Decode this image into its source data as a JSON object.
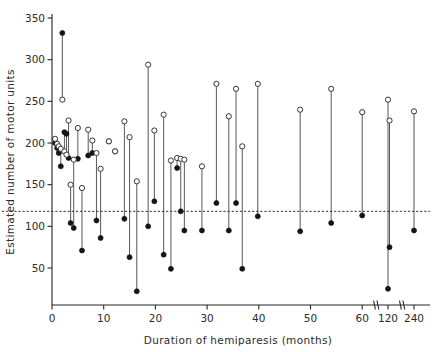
{
  "chart_data": {
    "type": "scatter",
    "title": "",
    "subtitle": "",
    "xlabel": "Duration of hemiparesis (months)",
    "ylabel": "Estimated number of motor units",
    "xlim": [
      0,
      63
    ],
    "ylim": [
      0,
      350
    ],
    "grid": false,
    "legend_position": "none",
    "axis_break": {
      "present": true,
      "note": "x-axis compressed after 60; break marks drawn between 60 and 120 and between 120 and 240",
      "break_labels": [
        "60",
        "120",
        "240"
      ]
    },
    "xticks": [
      0,
      10,
      20,
      30,
      40,
      50,
      60,
      120,
      240
    ],
    "xticklabels": [
      "0",
      "10",
      "20",
      "30",
      "40",
      "50",
      "60",
      "120",
      "240"
    ],
    "yticks": [
      50,
      100,
      150,
      200,
      250,
      300,
      350
    ],
    "yticklabels": [
      "50",
      "100",
      "150",
      "200",
      "250",
      "300",
      "350"
    ],
    "reference_line": {
      "orientation": "horizontal",
      "value": 118,
      "style": "dashed",
      "label": ""
    },
    "marker_styles": {
      "open_circle": "affected / paretic side upper value",
      "filled_circle": "lower value"
    },
    "series": [
      {
        "name": "open-circle (upper point)",
        "marker": "open-circle",
        "points": [
          {
            "x": 0.6,
            "y": 205
          },
          {
            "x": 1.0,
            "y": 199
          },
          {
            "x": 1.3,
            "y": 196
          },
          {
            "x": 1.7,
            "y": 193
          },
          {
            "x": 2.0,
            "y": 252
          },
          {
            "x": 2.4,
            "y": 190
          },
          {
            "x": 2.8,
            "y": 186
          },
          {
            "x": 3.2,
            "y": 227
          },
          {
            "x": 3.6,
            "y": 150
          },
          {
            "x": 4.2,
            "y": 180
          },
          {
            "x": 5.0,
            "y": 218
          },
          {
            "x": 5.8,
            "y": 146
          },
          {
            "x": 7.0,
            "y": 216
          },
          {
            "x": 7.8,
            "y": 203
          },
          {
            "x": 8.6,
            "y": 188
          },
          {
            "x": 9.4,
            "y": 169
          },
          {
            "x": 11.0,
            "y": 202
          },
          {
            "x": 12.2,
            "y": 190
          },
          {
            "x": 14.0,
            "y": 226
          },
          {
            "x": 15.0,
            "y": 207
          },
          {
            "x": 16.4,
            "y": 154
          },
          {
            "x": 18.6,
            "y": 294
          },
          {
            "x": 19.8,
            "y": 215
          },
          {
            "x": 21.6,
            "y": 234
          },
          {
            "x": 23.0,
            "y": 179
          },
          {
            "x": 24.2,
            "y": 182
          },
          {
            "x": 24.9,
            "y": 181
          },
          {
            "x": 25.6,
            "y": 180
          },
          {
            "x": 29.0,
            "y": 172
          },
          {
            "x": 31.8,
            "y": 271
          },
          {
            "x": 34.2,
            "y": 232
          },
          {
            "x": 35.6,
            "y": 265
          },
          {
            "x": 36.8,
            "y": 196
          },
          {
            "x": 39.8,
            "y": 271
          },
          {
            "x": 48.0,
            "y": 240
          },
          {
            "x": 54.0,
            "y": 265
          },
          {
            "x": 60.0,
            "y": 237
          },
          {
            "x": 120.0,
            "y": 252
          },
          {
            "x": 121.5,
            "y": 227
          },
          {
            "x": 240.0,
            "y": 238
          }
        ]
      },
      {
        "name": "filled-circle (lower point)",
        "marker": "filled-circle",
        "points": [
          {
            "x": 0.6,
            "y": 200
          },
          {
            "x": 1.0,
            "y": 194
          },
          {
            "x": 1.3,
            "y": 188
          },
          {
            "x": 1.7,
            "y": 172
          },
          {
            "x": 2.0,
            "y": 332
          },
          {
            "x": 2.4,
            "y": 213
          },
          {
            "x": 2.8,
            "y": 211
          },
          {
            "x": 3.2,
            "y": 182
          },
          {
            "x": 3.6,
            "y": 104
          },
          {
            "x": 4.2,
            "y": 98
          },
          {
            "x": 5.0,
            "y": 181
          },
          {
            "x": 5.8,
            "y": 71
          },
          {
            "x": 7.0,
            "y": 185
          },
          {
            "x": 7.8,
            "y": 188
          },
          {
            "x": 8.6,
            "y": 107
          },
          {
            "x": 9.4,
            "y": 86
          },
          {
            "x": 11.0,
            "y": 202
          },
          {
            "x": 12.2,
            "y": 190
          },
          {
            "x": 14.0,
            "y": 109
          },
          {
            "x": 15.0,
            "y": 63
          },
          {
            "x": 16.4,
            "y": 22
          },
          {
            "x": 18.6,
            "y": 100
          },
          {
            "x": 19.8,
            "y": 130
          },
          {
            "x": 21.6,
            "y": 66
          },
          {
            "x": 23.0,
            "y": 49
          },
          {
            "x": 24.2,
            "y": 170
          },
          {
            "x": 24.9,
            "y": 118
          },
          {
            "x": 25.6,
            "y": 95
          },
          {
            "x": 29.0,
            "y": 95
          },
          {
            "x": 31.8,
            "y": 128
          },
          {
            "x": 34.2,
            "y": 95
          },
          {
            "x": 35.6,
            "y": 128
          },
          {
            "x": 36.8,
            "y": 49
          },
          {
            "x": 39.8,
            "y": 112
          },
          {
            "x": 48.0,
            "y": 94
          },
          {
            "x": 54.0,
            "y": 104
          },
          {
            "x": 60.0,
            "y": 113
          },
          {
            "x": 120.0,
            "y": 25
          },
          {
            "x": 121.5,
            "y": 75
          },
          {
            "x": 240.0,
            "y": 95
          }
        ]
      }
    ]
  }
}
